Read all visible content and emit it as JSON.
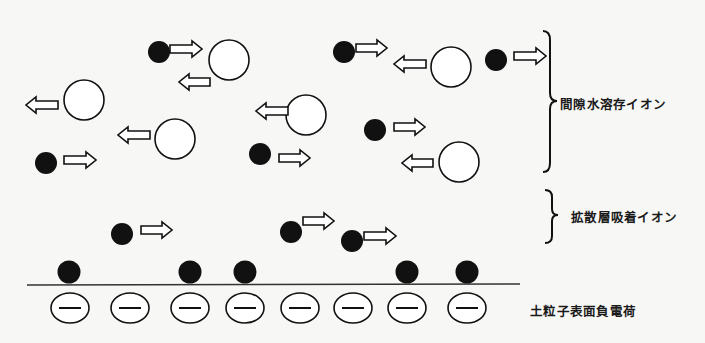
{
  "labels": {
    "pore_water_ions": "間隙水溶存イオン",
    "diffuse_layer_ions": "拡散層吸着イオン",
    "surface_charge": "土粒子表面負電荷"
  },
  "legend_semantics": {
    "cation": "black filled circle",
    "anion": "white open circle",
    "negative_charge": "minus sign in ellipse"
  },
  "ions": [
    {
      "type": "cation",
      "zone": "pore_water",
      "direction": "right"
    },
    {
      "type": "anion",
      "zone": "pore_water",
      "direction": "left"
    },
    {
      "type": "anion",
      "zone": "pore_water",
      "direction": "left"
    },
    {
      "type": "anion",
      "zone": "pore_water",
      "direction": "left"
    },
    {
      "type": "cation",
      "zone": "pore_water",
      "direction": "right"
    },
    {
      "type": "cation",
      "zone": "pore_water",
      "direction": "right"
    },
    {
      "type": "anion",
      "zone": "pore_water",
      "direction": "left"
    },
    {
      "type": "anion",
      "zone": "pore_water",
      "direction": "left"
    },
    {
      "type": "cation",
      "zone": "pore_water",
      "direction": "right"
    },
    {
      "type": "cation",
      "zone": "pore_water",
      "direction": "right"
    },
    {
      "type": "cation",
      "zone": "pore_water",
      "direction": "right"
    },
    {
      "type": "anion",
      "zone": "pore_water",
      "direction": "left"
    },
    {
      "type": "cation",
      "zone": "diffuse_layer",
      "direction": "right"
    },
    {
      "type": "cation",
      "zone": "diffuse_layer",
      "direction": "right"
    },
    {
      "type": "cation",
      "zone": "diffuse_layer",
      "direction": "right"
    }
  ],
  "surface": {
    "negative_charge_count": 8,
    "adsorbed_cation_count": 5,
    "charge_symbol": "−"
  },
  "colors": {
    "ink": "#111111",
    "background": "#f7f7f5"
  }
}
